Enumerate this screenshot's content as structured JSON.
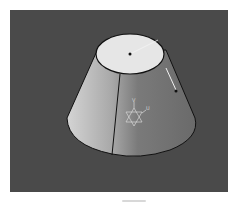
{
  "viewport": {
    "background": "#4a4a4a",
    "model": {
      "shape": "truncated-cone",
      "top_face_color": "#e6e6e6",
      "side_light_color": "#c8c8c8",
      "side_dark_color": "#6e6e6e",
      "edge_color": "#111111"
    },
    "axis_gizmo": {
      "label_v": "V",
      "label_u": "U",
      "color": "#d9d9d9"
    },
    "radius_handle_color": "#f2f2f2"
  },
  "icons": {
    "gizmo": "star-of-david-axis-icon",
    "center_point": "point-icon"
  }
}
